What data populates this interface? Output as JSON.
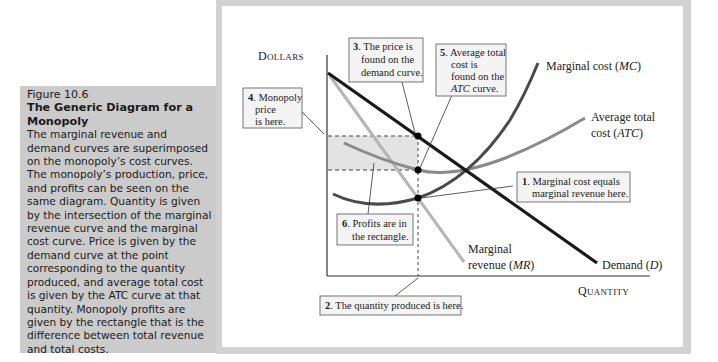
{
  "caption": {
    "figure_number": "Figure 10.6",
    "title": "The Generic Diagram for a Monopoly",
    "body": "The marginal revenue and demand curves are superimposed on the monopoly’s cost curves. The monopoly’s production, price, and profits can be seen on the same diagram. Quantity is given by the intersection of the marginal revenue curve and the marginal cost curve. Price is given by the demand curve at the point corresponding to the quantity produced, and average total cost is given by the ATC curve at that quantity. Monopoly profits are given by the rectangle that is the difference between total revenue and total costs."
  },
  "diagram": {
    "y_axis_label": "Dollars",
    "x_axis_label": "Quantity",
    "curves": {
      "mc": {
        "label_line1": "Marginal cost (",
        "label_abbr": "MC",
        "label_end": ")",
        "color": "#4a4a4a"
      },
      "atc": {
        "label_line1": "Average total",
        "label_line2": "cost (",
        "label_abbr": "ATC",
        "label_end": ")",
        "color": "#8a8a8a"
      },
      "mr": {
        "label_line1": "Marginal",
        "label_line2": "revenue (",
        "label_abbr": "MR",
        "label_end": ")",
        "color": "#b5b5b5"
      },
      "demand": {
        "label": "Demand (",
        "label_abbr": "D",
        "label_end": ")",
        "color": "#1a1a1a"
      }
    },
    "profit_fill": "#e3e3e3",
    "callouts": [
      {
        "num": "1",
        "lines": [
          "Marginal cost equals",
          "marginal revenue here."
        ]
      },
      {
        "num": "2",
        "lines": [
          "The quantity produced is here."
        ]
      },
      {
        "num": "3",
        "lines": [
          "The price is",
          "found on the",
          "demand curve."
        ]
      },
      {
        "num": "4",
        "lines": [
          "Monopoly",
          "price",
          "is here."
        ]
      },
      {
        "num": "5",
        "lines": [
          "Average total",
          "cost is",
          "found on the",
          "curve."
        ],
        "italic_prefix": "ATC"
      },
      {
        "num": "6",
        "lines": [
          "Profits are in",
          "the rectangle."
        ]
      }
    ]
  }
}
